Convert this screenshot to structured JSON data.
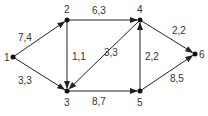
{
  "nodes": [
    {
      "id": "1",
      "x": 13,
      "y": 57,
      "lx": 4,
      "ly": 61
    },
    {
      "id": "2",
      "x": 67,
      "y": 20,
      "lx": 64,
      "ly": 13
    },
    {
      "id": "3",
      "x": 67,
      "y": 91,
      "lx": 64,
      "ly": 106
    },
    {
      "id": "4",
      "x": 140,
      "y": 20,
      "lx": 137,
      "ly": 13
    },
    {
      "id": "5",
      "x": 140,
      "y": 91,
      "lx": 137,
      "ly": 106
    },
    {
      "id": "6",
      "x": 195,
      "y": 54,
      "lx": 199,
      "ly": 58
    }
  ],
  "edges": [
    {
      "from": "1",
      "to": "2",
      "label": "7,4",
      "lx": 18,
      "ly": 41
    },
    {
      "from": "1",
      "to": "3",
      "label": "3,3",
      "lx": 18,
      "ly": 84
    },
    {
      "from": "2",
      "to": "4",
      "label": "6,3",
      "lx": 92,
      "ly": 14
    },
    {
      "from": "2",
      "to": "3",
      "label": "1,1",
      "lx": 72,
      "ly": 60
    },
    {
      "from": "4",
      "to": "3",
      "label": "3,3",
      "lx": 104,
      "ly": 56
    },
    {
      "from": "3",
      "to": "5",
      "label": "8,7",
      "lx": 92,
      "ly": 105
    },
    {
      "from": "5",
      "to": "4",
      "label": "2,2",
      "lx": 145,
      "ly": 60
    },
    {
      "from": "4",
      "to": "6",
      "label": "2,2",
      "lx": 172,
      "ly": 34
    },
    {
      "from": "5",
      "to": "6",
      "label": "8,5",
      "lx": 170,
      "ly": 82
    }
  ]
}
